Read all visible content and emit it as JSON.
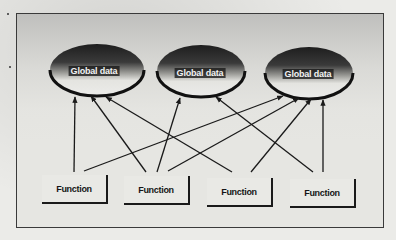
{
  "diagram": {
    "type": "global-data-access",
    "global_data": [
      {
        "id": "gd1",
        "label": "Global data"
      },
      {
        "id": "gd2",
        "label": "Global data"
      },
      {
        "id": "gd3",
        "label": "Global data"
      }
    ],
    "functions": [
      {
        "id": "f1",
        "label": "Function"
      },
      {
        "id": "f2",
        "label": "Function"
      },
      {
        "id": "f3",
        "label": "Function"
      },
      {
        "id": "f4",
        "label": "Function"
      }
    ],
    "connections": [
      {
        "from": "f1",
        "to": "gd1"
      },
      {
        "from": "f1",
        "to": "gd3"
      },
      {
        "from": "f2",
        "to": "gd1"
      },
      {
        "from": "f2",
        "to": "gd2"
      },
      {
        "from": "f2",
        "to": "gd3"
      },
      {
        "from": "f3",
        "to": "gd1"
      },
      {
        "from": "f3",
        "to": "gd3"
      },
      {
        "from": "f4",
        "to": "gd2"
      },
      {
        "from": "f4",
        "to": "gd3"
      }
    ],
    "colors": {
      "line": "#1a1a1a",
      "background": "#e6e6e2",
      "ellipse_top": "#2a2a2a",
      "ellipse_bottom": "#e8e8e4"
    }
  }
}
